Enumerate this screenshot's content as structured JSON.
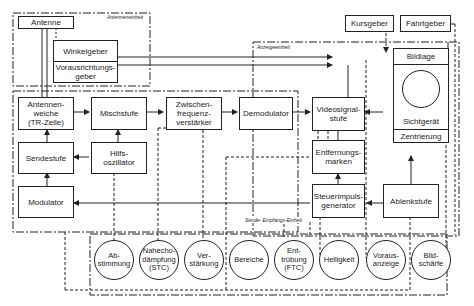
{
  "groups": {
    "antenna_unit": "Antenneneinheit",
    "display_unit": "Anzeigeeinheit",
    "transceiver_unit": "Sende- Empfangs-Einheit"
  },
  "blocks": {
    "antenne": "Antenne",
    "winkelgeber": "Winkelgeber",
    "vorausrichtungsgeber": "Vorausrichtungs-\ngeber",
    "kursgeber": "Kursgeber",
    "fahrtgeber": "Fahrtgeber",
    "bildlage": "Bildlage",
    "sichtgeraet": "Sichtgerät",
    "zentrierung": "Zentrierung",
    "antennenweiche": "Antennen-\nweiche\n(TR-Zelle)",
    "mischstufe": "Mischstufe",
    "zf_verstaerker": "Zwischen-\nfrequenz-\nverstärker",
    "demodulator": "Demodulator",
    "videosignalstufe": "Videosignal-\nstufe",
    "sendestufe": "Sendestufe",
    "hilfsoszillator": "Hilfs-\noszillator",
    "entfernungsmarken": "Entfernungs-\nmarken",
    "modulator": "Modulator",
    "steuerimpulsgenerator": "Steuerimpuls-\ngenerator",
    "ablenkstufe": "Ablenkstufe"
  },
  "controls": [
    {
      "label": "Ab-\nstimmung"
    },
    {
      "label": "Nahecho-\ndämpfung\n(STC)"
    },
    {
      "label": "Ver-\nstärkung"
    },
    {
      "label": "Bereiche"
    },
    {
      "label": "Ent-\ntrübung\n(FTC)"
    },
    {
      "label": "Helligkeit"
    },
    {
      "label": "Voraus-\nanzeige"
    },
    {
      "label": "Bild-\nschärfe"
    }
  ]
}
